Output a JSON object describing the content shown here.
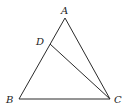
{
  "diagram": {
    "type": "triangle",
    "points": {
      "A": {
        "label": "A",
        "x": 65,
        "y": 18,
        "lx": 61,
        "ly": 14
      },
      "B": {
        "label": "B",
        "x": 19,
        "y": 99,
        "lx": 6,
        "ly": 103
      },
      "C": {
        "label": "C",
        "x": 110,
        "y": 99,
        "lx": 114,
        "ly": 103
      },
      "D": {
        "label": "D",
        "x": 50,
        "y": 44,
        "lx": 36,
        "ly": 45
      }
    },
    "segments": [
      {
        "from": "A",
        "to": "B"
      },
      {
        "from": "B",
        "to": "C"
      },
      {
        "from": "C",
        "to": "A"
      },
      {
        "from": "D",
        "to": "C"
      }
    ],
    "line_color": "#2b2b2b"
  }
}
